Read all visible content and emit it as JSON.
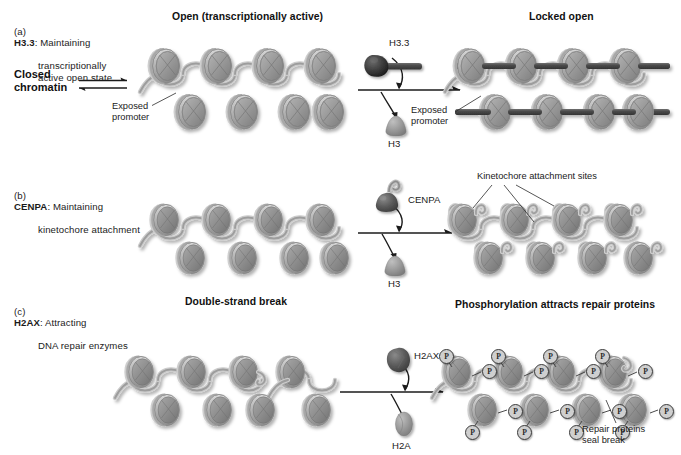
{
  "figure": {
    "background_color": "#ffffff",
    "nucleosome_fill": "#9a9a9a",
    "dna_ribbon_color": "#b9b9b9",
    "rod_color": "#4a4a4a",
    "ink_color": "#1b1b1b"
  },
  "panels": [
    {
      "letter": "(a)",
      "gene": "H3.3",
      "caption": ": Maintaining",
      "caption_lines": "transcriptionally\nactive open state",
      "left_note": {
        "text": "Closed\nchromatin",
        "arrow_type": "equilibrium"
      },
      "left_heading": "Open (transcriptionally active)",
      "right_heading": "Locked open",
      "annotations": [
        {
          "name": "exposed-promoter-left",
          "text": "Exposed\npromoter"
        },
        {
          "name": "exposed-promoter-right",
          "text": "Exposed\npromoter"
        }
      ],
      "reaction": {
        "incoming_protein": "H3.3",
        "incoming_shape": "dark-cone-with-rod",
        "outgoing_protein": "H3",
        "outgoing_shape": "gray-cone"
      },
      "chromatin_left": {
        "style": "open-zigzag",
        "top_row": 4,
        "bottom_row": 4
      },
      "chromatin_right": {
        "style": "locked-open-with-rods",
        "top_row": 4,
        "bottom_row": 4
      }
    },
    {
      "letter": "(b)",
      "gene": "CENPA",
      "caption": ": Maintaining",
      "caption_lines": "kinetochore attachment",
      "left_heading": "",
      "right_heading": "",
      "annotations": [
        {
          "name": "kinetochore-attachment-sites",
          "text": "Kinetochore attachment sites"
        }
      ],
      "reaction": {
        "incoming_protein": "CENPA",
        "incoming_shape": "dark-cone-with-hook",
        "outgoing_protein": "H3",
        "outgoing_shape": "gray-cone"
      },
      "chromatin_left": {
        "style": "open-zigzag",
        "top_row": 4,
        "bottom_row": 4
      },
      "chromatin_right": {
        "style": "hooked-nucleosomes",
        "top_row": 4,
        "bottom_row": 4
      }
    },
    {
      "letter": "(c)",
      "gene": "H2AX",
      "caption": ": Attracting",
      "caption_lines": "DNA repair enzymes",
      "left_heading": "Double-strand break",
      "right_heading": "Phosphorylation attracts repair proteins",
      "annotations": [
        {
          "name": "repair-proteins-seal-break",
          "text": "Repair proteins\nseal break"
        }
      ],
      "reaction": {
        "incoming_protein": "H2AX",
        "incoming_shape": "dark-angular-blob",
        "outgoing_protein": "H2A",
        "outgoing_shape": "gray-oval"
      },
      "chromatin_left": {
        "style": "open-zigzag-with-break",
        "top_row": 4,
        "bottom_row": 4
      },
      "chromatin_right": {
        "style": "phosphorylated",
        "top_row": 4,
        "bottom_row": 4,
        "phosphate_marker": "P"
      }
    }
  ],
  "markers": {
    "phosphate_label": "P"
  }
}
